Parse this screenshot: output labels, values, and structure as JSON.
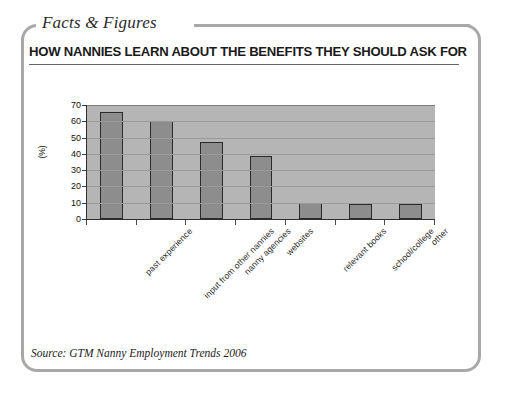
{
  "panel": {
    "eyebrow": "Facts & Figures",
    "headline": "HOW NANNIES LEARN ABOUT THE BENEFITS THEY SHOULD ASK FOR",
    "source": "Source: GTM Nanny Employment Trends 2006"
  },
  "colors": {
    "frame": "#a8a8a8",
    "plot_background": "#b5b5b5",
    "bar_fill": "#8d8d8d",
    "bar_outline": "#2a2a2a",
    "gridline": "#9a9a9a",
    "axis": "#2e2e2e",
    "text": "#1a1a1a"
  },
  "chart_data": {
    "type": "bar",
    "title": "HOW NANNIES LEARN ABOUT THE BENEFITS THEY SHOULD ASK FOR",
    "xlabel": "",
    "ylabel": "(%)",
    "categories": [
      "past experience",
      "input from other nannies",
      "nanny agencies",
      "websites",
      "relevant books",
      "school/college",
      "other"
    ],
    "values": [
      66,
      60,
      47,
      39,
      10,
      9,
      9
    ],
    "ylim": [
      0,
      70
    ],
    "yticks": [
      0,
      10,
      20,
      30,
      40,
      50,
      60,
      70
    ],
    "ytick_labels": [
      "0",
      "10",
      "20",
      "30",
      "40",
      "50",
      "60",
      "70"
    ],
    "grid": true,
    "legend": false
  }
}
